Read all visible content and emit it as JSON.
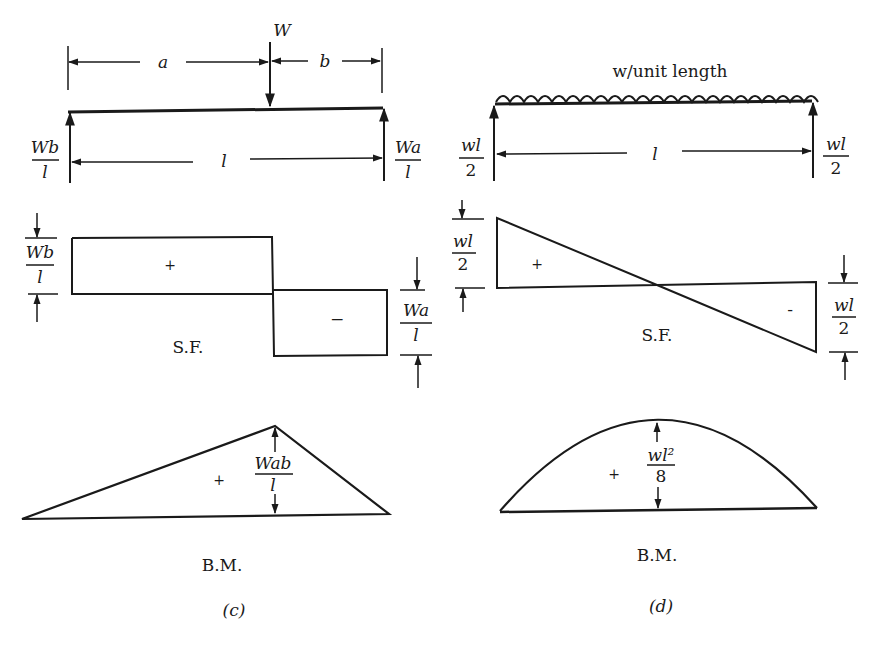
{
  "colors": {
    "ink": "#1a1a1a",
    "paper": "#ffffff"
  },
  "panel_c": {
    "caption": "(c)",
    "beam": {
      "load_label": "W",
      "dim_a": "a",
      "dim_b": "b",
      "span": "l",
      "left_reaction": {
        "num": "Wb",
        "den": "l"
      },
      "right_reaction": {
        "num": "Wa",
        "den": "l"
      }
    },
    "shear_force": {
      "title": "S.F.",
      "positive_sign": "+",
      "negative_sign": "−",
      "left_value": {
        "num": "Wb",
        "den": "l"
      },
      "right_value": {
        "num": "Wa",
        "den": "l"
      }
    },
    "bending_moment": {
      "title": "B.M.",
      "sign": "+",
      "max_value": {
        "num": "Wab",
        "den": "l"
      }
    }
  },
  "panel_d": {
    "caption": "(d)",
    "beam": {
      "load_label": "w/unit length",
      "span": "l",
      "left_reaction": {
        "num": "wl",
        "den": "2"
      },
      "right_reaction": {
        "num": "wl",
        "den": "2"
      }
    },
    "shear_force": {
      "title": "S.F.",
      "positive_sign": "+",
      "negative_sign": "-",
      "left_value": {
        "num": "wl",
        "den": "2"
      },
      "right_value": {
        "num": "wl",
        "den": "2"
      }
    },
    "bending_moment": {
      "title": "B.M.",
      "sign": "+",
      "max_value": {
        "num": "wl²",
        "den": "8"
      }
    }
  }
}
